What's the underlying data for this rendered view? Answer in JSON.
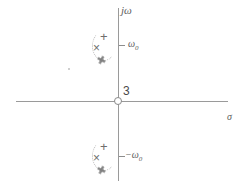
{
  "figure": {
    "type": "pole-zero-plot",
    "plane": "s-plane",
    "background_color": "#ffffff",
    "axis_color": "#9a9a9a",
    "mark_color": "#6e6e6e"
  },
  "axes": {
    "vertical_label": "jω",
    "horizontal_label": "σ",
    "tick_upper_label_main": "ω",
    "tick_upper_label_sub": "0",
    "tick_lower_label_main": "−ω",
    "tick_lower_label_sub": "0"
  },
  "origin": {
    "marker": "open-circle-zero",
    "multiplicity_label": "3"
  },
  "markers": {
    "upper_cluster": {
      "plus_glyph": "+",
      "cross_glyph": "×",
      "hatch_glyph": "✖",
      "location_label": "ω0"
    },
    "lower_cluster": {
      "plus_glyph": "+",
      "cross_glyph": "×",
      "hatch_glyph": "✖",
      "location_label": "−ω0"
    }
  },
  "chart_data": {
    "type": "scatter",
    "title": "",
    "xlabel": "σ",
    "ylabel": "jω",
    "xlim": [
      -5.0,
      5.0
    ],
    "ylim": [
      -4.0,
      4.0
    ],
    "grid": false,
    "legend": "none",
    "annotations": [
      {
        "text": "3",
        "x": 0.15,
        "y": 0.42,
        "meaning": "zero multiplicity at origin"
      },
      {
        "text": "ω0",
        "x": 0.45,
        "y": 1.45,
        "meaning": "upper tick label"
      },
      {
        "text": "−ω0",
        "x": 0.4,
        "y": -1.45,
        "meaning": "lower tick label"
      },
      {
        "text": "jω",
        "x": 0.2,
        "y": 3.5,
        "meaning": "imaginary axis label"
      },
      {
        "text": "σ",
        "x": 4.7,
        "y": -0.35,
        "meaning": "real axis label"
      }
    ],
    "series": [
      {
        "name": "zeros",
        "marker": "o",
        "x": [
          0
        ],
        "y": [
          0
        ],
        "labels": [
          "3"
        ]
      },
      {
        "name": "poles-plus",
        "marker": "+",
        "x": [
          -0.45,
          -0.45
        ],
        "y": [
          1.75,
          -1.75
        ]
      },
      {
        "name": "poles-cross",
        "marker": "x",
        "x": [
          -0.75,
          -0.75
        ],
        "y": [
          1.45,
          -1.45
        ]
      },
      {
        "name": "poles-hatch",
        "marker": "x-struck",
        "x": [
          -0.6,
          -0.6
        ],
        "y": [
          1.1,
          -1.1
        ]
      }
    ]
  }
}
